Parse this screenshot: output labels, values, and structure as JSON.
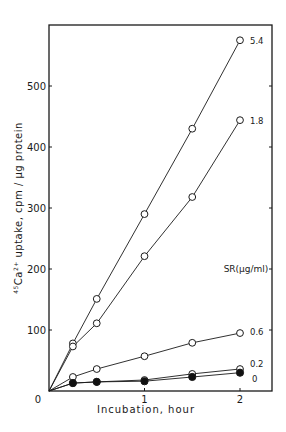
{
  "chart_data": {
    "type": "line",
    "title": "",
    "xlabel": "Incubation, hour",
    "ylabel": "45Ca2+ uptake, cpm / µg protein",
    "ylabel_parts": {
      "mass": "45",
      "element": "Ca",
      "charge": "2+",
      "rest": " uptake, cpm / µg protein"
    },
    "xlim": [
      0,
      2.3
    ],
    "ylim": [
      0,
      590
    ],
    "xticks": [
      0,
      1,
      2
    ],
    "xtick_labels": [
      "0",
      "1",
      "2"
    ],
    "yticks": [
      0,
      100,
      200,
      300,
      400,
      500
    ],
    "ytick_labels": [
      "0",
      "100",
      "200",
      "300",
      "400",
      "500"
    ],
    "grid": false,
    "legend_title": "SR(µg/ml)",
    "legend_position": "inline-right",
    "x": [
      0,
      0.25,
      0.5,
      1,
      1.5,
      2
    ],
    "series": [
      {
        "name": "5.4",
        "marker": "open-circle",
        "values": [
          0,
          78,
          151,
          290,
          430,
          575
        ]
      },
      {
        "name": "1.8",
        "marker": "open-circle",
        "values": [
          0,
          73,
          111,
          221,
          318,
          444
        ]
      },
      {
        "name": "0.6",
        "marker": "open-circle",
        "values": [
          0,
          23,
          36,
          57,
          79,
          95
        ]
      },
      {
        "name": "0.2",
        "marker": "open-circle",
        "values": [
          0,
          13,
          15,
          18,
          28,
          36
        ]
      },
      {
        "name": "0",
        "marker": "filled-circle",
        "values": [
          0,
          13,
          15,
          16,
          23,
          30
        ]
      }
    ]
  }
}
